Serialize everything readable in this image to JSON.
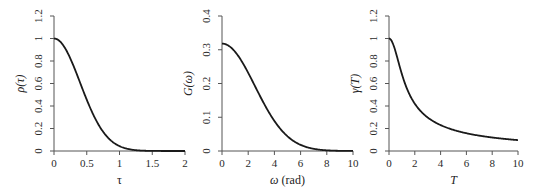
{
  "chart_data": [
    {
      "type": "line",
      "title": "",
      "xlabel": "τ",
      "ylabel": "ρ(τ)",
      "xlim": [
        0,
        2
      ],
      "ylim": [
        0,
        1.2
      ],
      "x_ticks": [
        "0",
        "0.5",
        "1",
        "1.5",
        "2"
      ],
      "y_ticks": [
        "0",
        "0.2",
        "0.4",
        "0.6",
        "0.8",
        "1",
        "1.2"
      ],
      "grid": false,
      "series": [
        {
          "name": "ρ(τ)",
          "x": [
            0,
            0.1,
            0.2,
            0.3,
            0.4,
            0.5,
            0.6,
            0.7,
            0.8,
            0.9,
            1.0,
            1.1,
            1.2,
            1.3,
            1.4,
            1.5,
            1.6,
            1.8,
            2.0
          ],
          "values": [
            1.0,
            0.969,
            0.882,
            0.754,
            0.605,
            0.456,
            0.323,
            0.214,
            0.134,
            0.079,
            0.043,
            0.022,
            0.011,
            0.005,
            0.002,
            0.001,
            0.0,
            0.0,
            0.0
          ]
        }
      ]
    },
    {
      "type": "line",
      "title": "",
      "xlabel": "ω (rad)",
      "ylabel": "G(ω)",
      "xlim": [
        0,
        10
      ],
      "ylim": [
        0,
        0.4
      ],
      "x_ticks": [
        "0",
        "2",
        "4",
        "6",
        "8",
        "10"
      ],
      "y_ticks": [
        "0",
        "0.1",
        "0.2",
        "0.3",
        "0.4"
      ],
      "grid": false,
      "series": [
        {
          "name": "G(ω)",
          "x": [
            0,
            0.5,
            1,
            1.5,
            2,
            2.5,
            3,
            3.5,
            4,
            4.5,
            5,
            5.5,
            6,
            6.5,
            7,
            7.5,
            8,
            9,
            10
          ],
          "values": [
            0.318,
            0.312,
            0.294,
            0.267,
            0.232,
            0.193,
            0.155,
            0.12,
            0.089,
            0.063,
            0.044,
            0.029,
            0.018,
            0.011,
            0.006,
            0.004,
            0.002,
            0.0,
            0.0
          ]
        }
      ]
    },
    {
      "type": "line",
      "title": "",
      "xlabel": "T",
      "ylabel": "γ(T)",
      "xlim": [
        0,
        10
      ],
      "ylim": [
        0,
        1.2
      ],
      "x_ticks": [
        "0",
        "2",
        "4",
        "6",
        "8",
        "10"
      ],
      "y_ticks": [
        "0",
        "0.2",
        "0.4",
        "0.6",
        "0.8",
        "1",
        "1.2"
      ],
      "grid": false,
      "series": [
        {
          "name": "γ(T)",
          "x": [
            0,
            0.25,
            0.5,
            0.75,
            1,
            1.5,
            2,
            2.5,
            3,
            4,
            5,
            6,
            7,
            8,
            9,
            10
          ],
          "values": [
            1.0,
            0.97,
            0.887,
            0.784,
            0.683,
            0.525,
            0.42,
            0.349,
            0.298,
            0.23,
            0.187,
            0.158,
            0.136,
            0.12,
            0.107,
            0.097
          ]
        }
      ]
    }
  ]
}
